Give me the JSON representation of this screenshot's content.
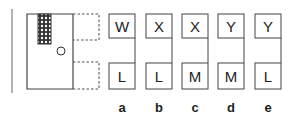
{
  "figure": {
    "colors": {
      "stroke": "#444444",
      "hatch": "#333333"
    },
    "question_shape": {
      "description": "square with hatched rectangle top-left, small circle, dashed outline squares on right"
    },
    "options": [
      {
        "label": "a",
        "top": "W",
        "bottom": "L"
      },
      {
        "label": "b",
        "top": "X",
        "bottom": "L"
      },
      {
        "label": "c",
        "top": "X",
        "bottom": "M"
      },
      {
        "label": "d",
        "top": "Y",
        "bottom": "M"
      },
      {
        "label": "e",
        "top": "Y",
        "bottom": "L"
      }
    ]
  }
}
